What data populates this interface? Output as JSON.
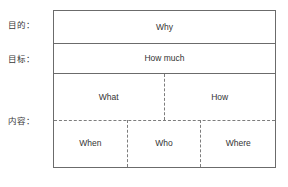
{
  "diagram": {
    "side_labels": {
      "purpose": "目的：",
      "goal": "目标：",
      "content": "内容："
    },
    "rows": [
      {
        "id": "why",
        "cells": [
          {
            "label": "Why"
          }
        ]
      },
      {
        "id": "how_much",
        "cells": [
          {
            "label": "How much"
          }
        ]
      },
      {
        "id": "what_how",
        "cells": [
          {
            "label": "What"
          },
          {
            "label": "How"
          }
        ]
      },
      {
        "id": "when_who_where",
        "cells": [
          {
            "label": "When"
          },
          {
            "label": "Who"
          },
          {
            "label": "Where"
          }
        ]
      }
    ],
    "caption": "",
    "colors": {
      "border_solid": "#6b6b6b",
      "border_dashed": "#7d7d7d",
      "text": "#333333",
      "label_text": "#3a3a3a",
      "background": "#ffffff"
    }
  }
}
